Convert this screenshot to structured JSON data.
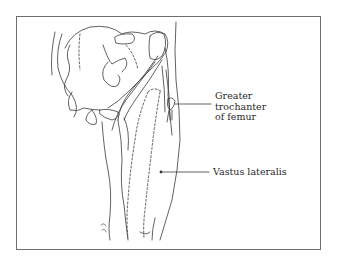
{
  "figure": {
    "border_color": "#6e6e6e",
    "line_color": "#3a3a3a",
    "labels": [
      {
        "id": "greater-trochanter",
        "lines": [
          "Greater",
          "trochanter",
          "of femur"
        ]
      },
      {
        "id": "vastus-lateralis",
        "lines": [
          "Vastus lateralis"
        ]
      }
    ]
  }
}
